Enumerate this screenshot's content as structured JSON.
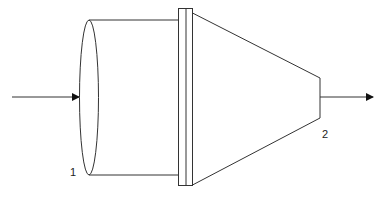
{
  "diagram": {
    "type": "nozzle-schematic",
    "labels": {
      "inlet": "1",
      "outlet": "2"
    },
    "colors": {
      "stroke": "#333333",
      "background": "#ffffff",
      "text": "#222222"
    },
    "components": [
      {
        "id": "inlet-arrow",
        "description": "flow entering"
      },
      {
        "id": "inlet-ellipse",
        "description": "inlet cross-section"
      },
      {
        "id": "cylinder",
        "description": "cylindrical section"
      },
      {
        "id": "flange",
        "description": "double flange joint"
      },
      {
        "id": "cone",
        "description": "converging cone section"
      },
      {
        "id": "outlet-arrow",
        "description": "flow exiting"
      }
    ]
  }
}
